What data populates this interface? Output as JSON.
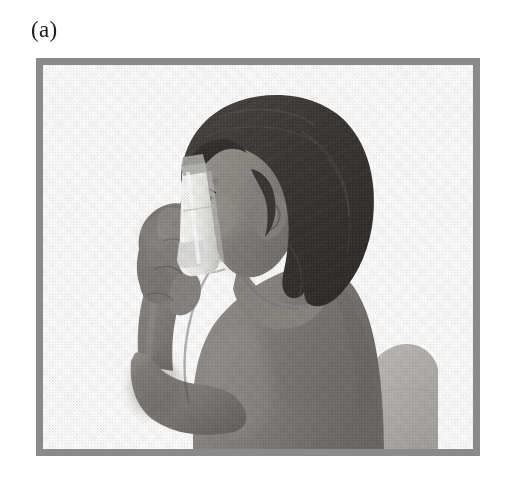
{
  "figure": {
    "panel_label": "(a)",
    "caption_alt": "Person in side profile holding a metered-dose inhaler to the mouth and inhaling",
    "style": "grayscale halftone medical illustration",
    "orientation": "facing-left profile",
    "frame": {
      "border_color": "#8a8a8a",
      "border_width_px": 7,
      "background_color": "#ffffff",
      "left_px": 36,
      "top_px": 58,
      "width_px": 444,
      "height_px": 398
    },
    "palette": {
      "page_background": "#ffffff",
      "frame_border": "#8a8a8a",
      "hair_dark": "#3d3a38",
      "hair_mid": "#56514e",
      "skin_mid": "#8e8a86",
      "skin_shadow": "#6f6b68",
      "skin_highlight": "#a7a29e",
      "torso_body": "#85817d",
      "torso_shadow": "#6a6663",
      "inhaler_body": "#e8e8e6",
      "inhaler_shade": "#cfcfcc",
      "inhaler_cap": "#b9b9b5",
      "chair_light": "#b6b4b1",
      "chair_shadow": "#a3a19e",
      "label_text": "#1a1a1a"
    },
    "elements": [
      {
        "name": "hair",
        "description": "dark short wavy hair covering crown, back of head and nape"
      },
      {
        "name": "face-profile",
        "description": "left-facing profile with brow, eye, nose, lips and chin"
      },
      {
        "name": "ear",
        "description": "ear visible beneath hair on side of head"
      },
      {
        "name": "neck",
        "description": "neck joining head to shoulders"
      },
      {
        "name": "torso",
        "description": "upper back, shoulder and chest in mid gray"
      },
      {
        "name": "raised-arm",
        "description": "right arm bent upward bringing hand to the mouth"
      },
      {
        "name": "hand",
        "description": "fingers curled around the inhaler canister"
      },
      {
        "name": "inhaler",
        "description": "white metered-dose inhaler canister with mouthpiece at lips"
      },
      {
        "name": "chair-back",
        "description": "light gray chair back or cushion behind the lower right of the figure"
      }
    ]
  }
}
